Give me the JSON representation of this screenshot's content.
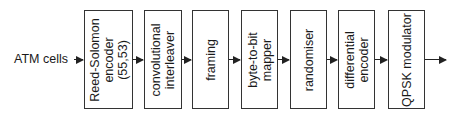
{
  "input": {
    "label": "ATM cells"
  },
  "blocks": [
    {
      "id": "reed-solomon-encoder",
      "lines": [
        "Reed-Solomon",
        "encoder",
        "(55,53)"
      ]
    },
    {
      "id": "convolutional-interleaver",
      "lines": [
        "convolutional",
        "interleaver"
      ]
    },
    {
      "id": "framing",
      "lines": [
        "framing"
      ]
    },
    {
      "id": "byte-to-bit-mapper",
      "lines": [
        "byte-to-bit",
        "mapper"
      ]
    },
    {
      "id": "randomiser",
      "lines": [
        "randomiser"
      ]
    },
    {
      "id": "differential-encoder",
      "lines": [
        "differential",
        "encoder"
      ]
    },
    {
      "id": "qpsk-modulator",
      "lines": [
        "QPSK modulator"
      ]
    }
  ],
  "colors": {
    "line": "#222222",
    "border": "#333333",
    "background": "#ffffff"
  }
}
